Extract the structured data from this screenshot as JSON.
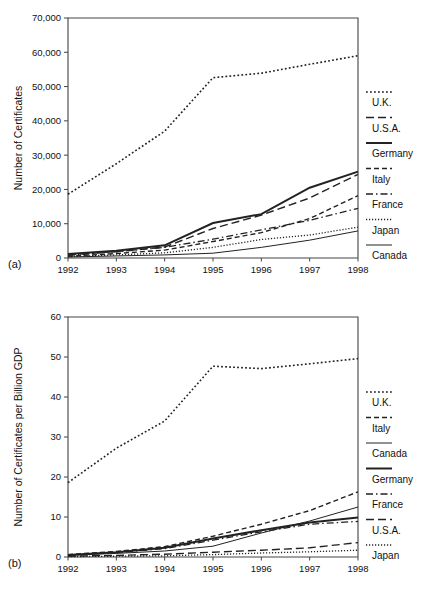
{
  "figure": {
    "panel_a_label": "(a)",
    "panel_b_label": "(b)"
  },
  "chart_data": [
    {
      "id": "a",
      "type": "line",
      "title": "",
      "xlabel": "",
      "ylabel": "Number of Certificates",
      "x": [
        1992,
        1993,
        1994,
        1995,
        1996,
        1997,
        1998
      ],
      "xtick_labels": [
        "1992",
        "1993",
        "1994",
        "1995",
        "1996",
        "1997",
        "1998"
      ],
      "xlim": [
        1992,
        1998
      ],
      "ylim": [
        0,
        70000
      ],
      "yticks": [
        0,
        10000,
        20000,
        30000,
        40000,
        50000,
        60000,
        70000
      ],
      "ytick_labels": [
        "0",
        "10,000",
        "20,000",
        "30,000",
        "40,000",
        "50,000",
        "60,000",
        "70,000"
      ],
      "grid": false,
      "legend_position": "right",
      "series": [
        {
          "name": "U.K.",
          "style": "dotted",
          "width": 1.6,
          "values": [
            18600,
            27500,
            37000,
            52600,
            53900,
            56500,
            59000
          ]
        },
        {
          "name": "U.S.A.",
          "style": "longdash",
          "width": 1.4,
          "values": [
            900,
            1900,
            3200,
            8600,
            12500,
            17500,
            24400
          ]
        },
        {
          "name": "Germany",
          "style": "solid",
          "width": 2.0,
          "values": [
            1200,
            2100,
            3700,
            10200,
            12800,
            20500,
            25200
          ]
        },
        {
          "name": "Italy",
          "style": "dashed",
          "width": 1.4,
          "values": [
            500,
            1300,
            2300,
            4800,
            7400,
            11500,
            18200
          ]
        },
        {
          "name": "France",
          "style": "dashdot",
          "width": 1.3,
          "values": [
            800,
            1800,
            3100,
            5500,
            8200,
            11000,
            14500
          ]
        },
        {
          "name": "Japan",
          "style": "finedot",
          "width": 1.3,
          "values": [
            400,
            900,
            1500,
            3100,
            5400,
            6700,
            9000
          ]
        },
        {
          "name": "Canada",
          "style": "thin",
          "width": 1.0,
          "values": [
            300,
            600,
            900,
            1400,
            3100,
            5200,
            7900
          ]
        }
      ]
    },
    {
      "id": "b",
      "type": "line",
      "title": "",
      "xlabel": "",
      "ylabel": "Number of Certificates per Billion GDP",
      "x": [
        1992,
        1993,
        1994,
        1995,
        1996,
        1997,
        1998
      ],
      "xtick_labels": [
        "1992",
        "1993",
        "1994",
        "1995",
        "1996",
        "1997",
        "1998"
      ],
      "xlim": [
        1992,
        1998
      ],
      "ylim": [
        0,
        60
      ],
      "yticks": [
        0,
        10,
        20,
        30,
        40,
        50,
        60
      ],
      "ytick_labels": [
        "0",
        "10",
        "20",
        "30",
        "40",
        "50",
        "60"
      ],
      "grid": false,
      "legend_position": "right",
      "series": [
        {
          "name": "U.K.",
          "style": "dotted",
          "width": 1.6,
          "values": [
            18.6,
            27.2,
            34.0,
            47.7,
            47.1,
            48.3,
            49.6
          ]
        },
        {
          "name": "Italy",
          "style": "dashed",
          "width": 1.4,
          "values": [
            0.6,
            1.4,
            2.6,
            5.2,
            8.2,
            11.6,
            16.3
          ]
        },
        {
          "name": "Canada",
          "style": "thin",
          "width": 1.0,
          "values": [
            0.4,
            0.9,
            1.5,
            2.7,
            6.0,
            9.0,
            12.5
          ]
        },
        {
          "name": "Germany",
          "style": "solid",
          "width": 2.0,
          "values": [
            0.5,
            1.2,
            2.3,
            4.6,
            6.7,
            8.6,
            9.9
          ]
        },
        {
          "name": "France",
          "style": "dashdot",
          "width": 1.3,
          "values": [
            0.5,
            1.1,
            2.1,
            4.2,
            6.3,
            8.2,
            8.9
          ]
        },
        {
          "name": "U.S.A.",
          "style": "longdash",
          "width": 1.4,
          "values": [
            0.2,
            0.4,
            0.7,
            1.2,
            1.7,
            2.3,
            3.6
          ]
        },
        {
          "name": "Japan",
          "style": "finedot",
          "width": 1.3,
          "values": [
            0.1,
            0.2,
            0.3,
            0.6,
            1.0,
            1.3,
            1.7
          ]
        }
      ]
    }
  ]
}
